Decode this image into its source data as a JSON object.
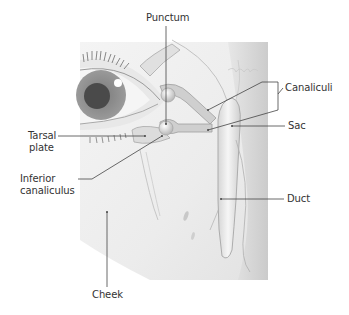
{
  "diagram": {
    "labels": {
      "punctum": "Punctum",
      "canaliculi": "Canaliculi",
      "sac": "Sac",
      "tarsal_plate_line1": "Tarsal",
      "tarsal_plate_line2": "plate",
      "inferior_canaliculus_line1": "Inferior",
      "inferior_canaliculus_line2": "canaliculus",
      "duct": "Duct",
      "cheek": "Cheek"
    },
    "colors": {
      "background": "#ffffff",
      "panel": "#eeeeee",
      "panel_dark": "#cfcfcf",
      "iris": "#8a8a8a",
      "pupil": "#4a4a4a",
      "leader_line": "#444444",
      "label_text": "#333333"
    }
  }
}
